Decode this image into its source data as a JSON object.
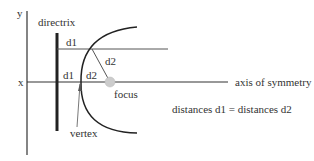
{
  "diagram": {
    "type": "parabola-directrix-focus",
    "labels": {
      "y_axis": "y",
      "x_axis": "x",
      "directrix": "directrix",
      "d1_upper": "d1",
      "d2_upper": "d2",
      "d1_lower": "d1",
      "d2_lower": "d2",
      "focus": "focus",
      "vertex": "vertex",
      "axis_of_symmetry": "axis of symmetry",
      "equation": "distances d1 = distances d2"
    },
    "colors": {
      "line": "#333333",
      "focus_fill": "#cccccc",
      "text": "#333333"
    }
  }
}
